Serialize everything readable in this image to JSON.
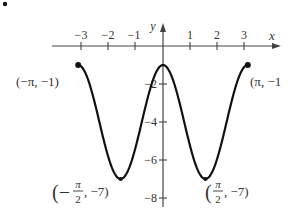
{
  "bullet": "•",
  "chart_data": {
    "type": "line",
    "title": "",
    "function": "y = -4 + 3cos(2x)",
    "xlabel": "x",
    "ylabel": "y",
    "xlim": [
      -3.14159,
      3.14159
    ],
    "ylim": [
      -8,
      0
    ],
    "grid": false,
    "x_ticks": [
      -3,
      -2,
      -1,
      1,
      2,
      3
    ],
    "x_tick_labels": [
      "−3",
      "−2",
      "−1",
      "1",
      "2",
      "3"
    ],
    "y_ticks": [
      -2,
      -4,
      -6,
      -8
    ],
    "y_tick_labels": [
      "−2",
      "−4",
      "−6",
      "−8"
    ],
    "series": [
      {
        "name": "curve",
        "x": [
          -3.14159,
          -2.356,
          -1.5708,
          -0.785,
          0,
          0.785,
          1.5708,
          2.356,
          3.14159
        ],
        "y": [
          -1,
          -4,
          -7,
          -4,
          -1,
          -4,
          -7,
          -4,
          -1
        ]
      }
    ],
    "annotations": [
      {
        "point": [
          -3.14159,
          -1
        ],
        "label": "(−π, −1)"
      },
      {
        "point": [
          3.14159,
          -1
        ],
        "label": "(π, −1)"
      },
      {
        "point": [
          -1.5708,
          -7
        ],
        "label": "(−π/2, −7)"
      },
      {
        "point": [
          1.5708,
          -7
        ],
        "label": "(π/2, −7)"
      }
    ]
  },
  "labels": {
    "x_axis": "x",
    "y_axis": "y",
    "xt": [
      "−3",
      "−2",
      "−1",
      "1",
      "2",
      "3"
    ],
    "yt": [
      "−2",
      "−4",
      "−6",
      "−8"
    ],
    "left_end": "(−π, −1)",
    "right_end": "(π, −1",
    "min_left_open": "(−",
    "min_left_num": "π",
    "min_left_den": "2",
    "min_left_close": ", −7)",
    "min_right_open": "(",
    "min_right_num": "π",
    "min_right_den": "2",
    "min_right_close": ", −7)"
  }
}
